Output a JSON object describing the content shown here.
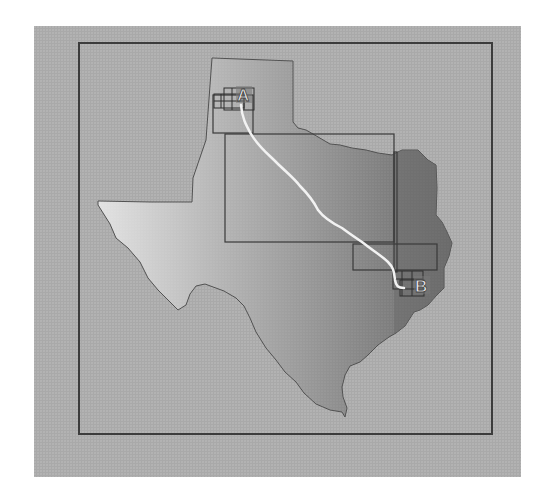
{
  "map": {
    "region": "Texas",
    "markers": [
      {
        "id": "start",
        "label": "A"
      },
      {
        "id": "end",
        "label": "B"
      }
    ],
    "colors": {
      "panel_bg": "#a9a9a9",
      "frame_border": "#3c3c3c",
      "state_light": "#dcdcdc",
      "state_mid": "#9a9a9a",
      "state_dark": "#6a6a6a",
      "route": "#f2f2f2",
      "tile_border": "#3a3a3a"
    }
  }
}
